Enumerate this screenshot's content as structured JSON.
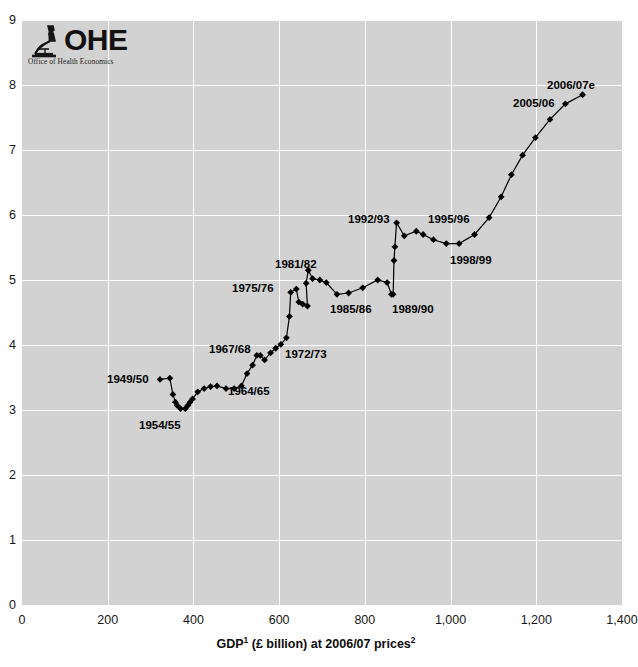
{
  "logo": {
    "name": "ohe-logo",
    "acronym": "OHE",
    "subtitle": "Office of Health Economics",
    "icon": "microscope-icon"
  },
  "chart_data": {
    "type": "line",
    "title": "",
    "subtitle": "",
    "xlabel": "GDP¹ (£ billion) at 2006/07 prices²",
    "xlabel_parts": {
      "base1": "GDP",
      "sup1": "1",
      "mid": " (£ billion) at 2006/07 prices",
      "sup2": "2"
    },
    "ylabel": "",
    "xlim": [
      0,
      1400
    ],
    "ylim": [
      0,
      9
    ],
    "xticks": [
      0,
      200,
      400,
      600,
      800,
      1000,
      1200,
      1400
    ],
    "xtick_labels": [
      "0",
      "200",
      "400",
      "600",
      "800",
      "1,000",
      "1,200",
      "1,400"
    ],
    "yticks": [
      0,
      1,
      2,
      3,
      4,
      5,
      6,
      7,
      8,
      9
    ],
    "ytick_labels": [
      "0",
      "1",
      "2",
      "3",
      "4",
      "5",
      "6",
      "7",
      "8",
      "9"
    ],
    "grid": true,
    "legend": "none",
    "marker": "diamond",
    "line_color": "#000000",
    "marker_color": "#000000",
    "plot_background": "#d2d2d2",
    "series": [
      {
        "name": "NHS expenditure vs GDP",
        "points": [
          {
            "label": "1949/50",
            "x": 322,
            "y": 3.47
          },
          {
            "label": "",
            "x": 345,
            "y": 3.49
          },
          {
            "label": "",
            "x": 352,
            "y": 3.24
          },
          {
            "label": "",
            "x": 358,
            "y": 3.12
          },
          {
            "label": "",
            "x": 362,
            "y": 3.07
          },
          {
            "label": "1954/55",
            "x": 370,
            "y": 3.02
          },
          {
            "label": "",
            "x": 381,
            "y": 3.02
          },
          {
            "label": "",
            "x": 387,
            "y": 3.07
          },
          {
            "label": "",
            "x": 392,
            "y": 3.12
          },
          {
            "label": "",
            "x": 398,
            "y": 3.17
          },
          {
            "label": "",
            "x": 410,
            "y": 3.28
          },
          {
            "label": "",
            "x": 425,
            "y": 3.33
          },
          {
            "label": "",
            "x": 440,
            "y": 3.36
          },
          {
            "label": "",
            "x": 455,
            "y": 3.37
          },
          {
            "label": "",
            "x": 476,
            "y": 3.33
          },
          {
            "label": "",
            "x": 495,
            "y": 3.33
          },
          {
            "label": "1964/65",
            "x": 512,
            "y": 3.37
          },
          {
            "label": "",
            "x": 525,
            "y": 3.56
          },
          {
            "label": "",
            "x": 538,
            "y": 3.69
          },
          {
            "label": "",
            "x": 548,
            "y": 3.84
          },
          {
            "label": "1967/68",
            "x": 556,
            "y": 3.84
          },
          {
            "label": "",
            "x": 566,
            "y": 3.77
          },
          {
            "label": "",
            "x": 580,
            "y": 3.88
          },
          {
            "label": "",
            "x": 592,
            "y": 3.95
          },
          {
            "label": "",
            "x": 604,
            "y": 4.01
          },
          {
            "label": "1972/73",
            "x": 617,
            "y": 4.11
          },
          {
            "label": "",
            "x": 624,
            "y": 4.44
          },
          {
            "label": "1975/76",
            "x": 627,
            "y": 4.81
          },
          {
            "label": "",
            "x": 640,
            "y": 4.86
          },
          {
            "label": "",
            "x": 646,
            "y": 4.66
          },
          {
            "label": "",
            "x": 655,
            "y": 4.63
          },
          {
            "label": "",
            "x": 666,
            "y": 4.6
          },
          {
            "label": "",
            "x": 663,
            "y": 4.95
          },
          {
            "label": "1981/82",
            "x": 668,
            "y": 5.15
          },
          {
            "label": "",
            "x": 678,
            "y": 5.02
          },
          {
            "label": "",
            "x": 695,
            "y": 5.0
          },
          {
            "label": "",
            "x": 710,
            "y": 4.96
          },
          {
            "label": "1985/86",
            "x": 735,
            "y": 4.78
          },
          {
            "label": "",
            "x": 762,
            "y": 4.8
          },
          {
            "label": "",
            "x": 795,
            "y": 4.88
          },
          {
            "label": "",
            "x": 830,
            "y": 5.0
          },
          {
            "label": "",
            "x": 852,
            "y": 4.96
          },
          {
            "label": "1989/90",
            "x": 862,
            "y": 4.78
          },
          {
            "label": "",
            "x": 866,
            "y": 4.78
          },
          {
            "label": "",
            "x": 868,
            "y": 5.3
          },
          {
            "label": "",
            "x": 870,
            "y": 5.51
          },
          {
            "label": "1992/93",
            "x": 874,
            "y": 5.88
          },
          {
            "label": "",
            "x": 892,
            "y": 5.68
          },
          {
            "label": "",
            "x": 920,
            "y": 5.75
          },
          {
            "label": "1995/96",
            "x": 936,
            "y": 5.7
          },
          {
            "label": "",
            "x": 960,
            "y": 5.62
          },
          {
            "label": "",
            "x": 990,
            "y": 5.56
          },
          {
            "label": "1998/99",
            "x": 1020,
            "y": 5.56
          },
          {
            "label": "",
            "x": 1056,
            "y": 5.7
          },
          {
            "label": "",
            "x": 1090,
            "y": 5.96
          },
          {
            "label": "",
            "x": 1118,
            "y": 6.28
          },
          {
            "label": "",
            "x": 1142,
            "y": 6.62
          },
          {
            "label": "",
            "x": 1168,
            "y": 6.92
          },
          {
            "label": "",
            "x": 1198,
            "y": 7.19
          },
          {
            "label": "",
            "x": 1232,
            "y": 7.47
          },
          {
            "label": "2005/06",
            "x": 1268,
            "y": 7.71
          },
          {
            "label": "2006/07e",
            "x": 1308,
            "y": 7.85
          }
        ]
      }
    ],
    "annotations": [
      {
        "text": "1949/50",
        "x_px": 107,
        "y_px": 373
      },
      {
        "text": "1954/55",
        "x_px": 139,
        "y_px": 419
      },
      {
        "text": "1964/65",
        "x_px": 228,
        "y_px": 385
      },
      {
        "text": "1967/68",
        "x_px": 209,
        "y_px": 343
      },
      {
        "text": "1972/73",
        "x_px": 285,
        "y_px": 348
      },
      {
        "text": "1975/76",
        "x_px": 232,
        "y_px": 282
      },
      {
        "text": "1981/82",
        "x_px": 275,
        "y_px": 258
      },
      {
        "text": "1985/86",
        "x_px": 330,
        "y_px": 303
      },
      {
        "text": "1989/90",
        "x_px": 392,
        "y_px": 303
      },
      {
        "text": "1992/93",
        "x_px": 348,
        "y_px": 213
      },
      {
        "text": "1995/96",
        "x_px": 428,
        "y_px": 213
      },
      {
        "text": "1998/99",
        "x_px": 450,
        "y_px": 254
      },
      {
        "text": "2005/06",
        "x_px": 513,
        "y_px": 97
      },
      {
        "text": "2006/07e",
        "x_px": 547,
        "y_px": 79
      }
    ]
  }
}
